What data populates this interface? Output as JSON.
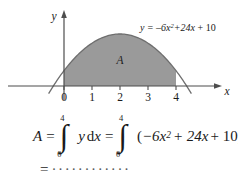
{
  "figure": {
    "curve_label": "y = –6x²+24x + 10",
    "curve_label_parts": {
      "lhs": "y",
      "equals": "=",
      "term1_coef": "–6x",
      "term1_exp": "2",
      "term2": "+24x",
      "term3": "+ 10"
    },
    "area_label": "A",
    "y_axis_label": "y",
    "x_axis_label": "x",
    "x_ticks": [
      "0",
      "1",
      "2",
      "3",
      "4"
    ],
    "colors": {
      "fill": "#9a9a9a",
      "curve": "#6e6e6e",
      "axis": "#4d4d4d",
      "text": "#1a1a1a",
      "background": "#ffffff"
    },
    "function": {
      "expression": "-6x^2 + 24x + 10",
      "a": -6,
      "b": 24,
      "c": 10,
      "shade_from": 0,
      "shade_to": 4
    }
  },
  "formula": {
    "area_symbol": "A",
    "equals_1": "=",
    "integral_1": {
      "upper": "4",
      "lower": "0",
      "integrand": "y",
      "differential_d": "d",
      "differential_var": "x"
    },
    "equals_2": "=",
    "integral_2": {
      "upper": "4",
      "lower": "0",
      "open_paren": "(",
      "term1_coef": "−6x",
      "term1_exp": "2",
      "term2": "+ 24x",
      "term3": "+ 10",
      "close_paren": ")",
      "differential_d": "d",
      "differential_var": "x"
    }
  },
  "result": {
    "equals": "=",
    "blank": "············"
  }
}
